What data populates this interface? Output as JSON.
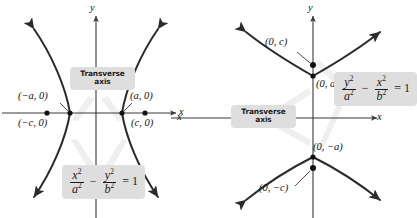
{
  "figure": {
    "colors": {
      "curve": "#2b2b2b",
      "axis": "#3a3a3a",
      "callout_bg": "#dedede",
      "leader": "#eeeeee",
      "point": "#111111",
      "text": "#111111",
      "background": "#ffffff"
    },
    "panels": [
      {
        "id": "horizontal-transverse-axis",
        "axes": {
          "x_label": "x",
          "y_label": "y"
        },
        "callout": {
          "line1": "Transverse",
          "line2": "axis"
        },
        "equation": {
          "num1": "x",
          "den1": "a",
          "num2": "y",
          "den2": "b",
          "operator": "−",
          "rhs": "= 1",
          "exponent": "2",
          "plain": "x²/a² − y²/b² = 1"
        },
        "points": [
          {
            "name": "vertex-left",
            "label": "(−a, 0)"
          },
          {
            "name": "vertex-right",
            "label": "(a, 0)"
          },
          {
            "name": "focus-left",
            "label": "(−c, 0)"
          },
          {
            "name": "focus-right",
            "label": "(c, 0)"
          }
        ]
      },
      {
        "id": "vertical-transverse-axis",
        "axes": {
          "x_label": "x",
          "y_label": "y",
          "x_label_left": "x"
        },
        "callout": {
          "line1": "Transverse",
          "line2": "axis"
        },
        "equation": {
          "num1": "y",
          "den1": "a",
          "num2": "x",
          "den2": "b",
          "operator": "−",
          "rhs": "= 1",
          "exponent": "2",
          "plain": "y²/a² − x²/b² = 1"
        },
        "points": [
          {
            "name": "vertex-upper",
            "label": "(0, a)"
          },
          {
            "name": "vertex-lower",
            "label": "(0, −a)"
          },
          {
            "name": "focus-upper",
            "label": "(0, c)"
          },
          {
            "name": "focus-lower",
            "label": "(0, −c)"
          }
        ]
      }
    ]
  }
}
